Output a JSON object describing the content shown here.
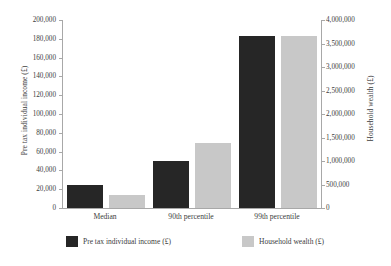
{
  "chart_data": {
    "type": "bar",
    "title": "",
    "subtitle": "",
    "xlabel": "",
    "ylabel": "Pre tax individual income (£)",
    "y2label": "Household wealth (£)",
    "categories": [
      "Median",
      "90th percentile",
      "99th percentile"
    ],
    "series": [
      {
        "name": "Pre tax individual income (£)",
        "axis": "left",
        "color": "#262626",
        "values": [
          24000,
          50000,
          183000
        ]
      },
      {
        "name": "Household wealth (£)",
        "axis": "right",
        "color": "#c8c8c8",
        "values": [
          280000,
          1380000,
          3660000
        ]
      }
    ],
    "ylim": [
      0,
      200000
    ],
    "y2lim": [
      0,
      4000000
    ],
    "ytick_labels": [
      "200,000",
      "180,000",
      "160,000",
      "140,000",
      "120,000",
      "100,000",
      "80,000",
      "60,000",
      "40,000",
      "20,000",
      "0"
    ],
    "ytick_values": [
      200000,
      180000,
      160000,
      140000,
      120000,
      100000,
      80000,
      60000,
      40000,
      20000,
      0
    ],
    "y2tick_labels": [
      "4,000,000",
      "3,500,000",
      "3,000,000",
      "2,500,000",
      "2,000,000",
      "1,500,000",
      "1,000,000",
      "500,000",
      "0"
    ],
    "y2tick_values": [
      4000000,
      3500000,
      3000000,
      2500000,
      2000000,
      1500000,
      1000000,
      500000,
      0
    ],
    "grid": false,
    "legend_position": "bottom",
    "legend_entries": [
      {
        "label": "Pre tax individual income (£)",
        "color": "#262626"
      },
      {
        "label": "Household wealth (£)",
        "color": "#c8c8c8"
      }
    ]
  }
}
